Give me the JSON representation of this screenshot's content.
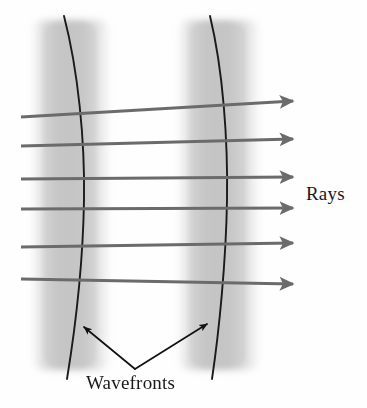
{
  "figure": {
    "background_color": "#fefefe",
    "labels": {
      "rays": "Rays",
      "wavefronts": "Wavefronts"
    },
    "colors": {
      "ray_stroke": "#6b6b6b",
      "wavefront_stroke": "#1a1a1a",
      "band_fill": "#c9c9c9",
      "pointer_stroke": "#111111",
      "text": "#1a1a1a"
    },
    "wavefront_bands": [
      {
        "name": "left-band",
        "x_start": 30,
        "x_end": 112,
        "y_start": 18,
        "y_end": 372
      },
      {
        "name": "right-band",
        "x_start": 176,
        "x_end": 262,
        "y_start": 18,
        "y_end": 372
      }
    ],
    "wavefront_curves": [
      {
        "name": "left-wavefront",
        "top": {
          "x": 64,
          "y": 16
        },
        "mid": {
          "x": 84,
          "y": 196
        },
        "bottom": {
          "x": 67,
          "y": 378
        }
      },
      {
        "name": "right-wavefront",
        "top": {
          "x": 210,
          "y": 16
        },
        "mid": {
          "x": 227,
          "y": 196
        },
        "bottom": {
          "x": 212,
          "y": 378
        }
      }
    ],
    "rays": [
      {
        "index": 1,
        "x1": 21,
        "y1": 117,
        "x2": 299,
        "y2": 100
      },
      {
        "index": 2,
        "x1": 21,
        "y1": 146,
        "x2": 299,
        "y2": 138
      },
      {
        "index": 3,
        "x1": 21,
        "y1": 179,
        "x2": 299,
        "y2": 177
      },
      {
        "index": 4,
        "x1": 21,
        "y1": 209,
        "x2": 299,
        "y2": 208
      },
      {
        "index": 5,
        "x1": 21,
        "y1": 247,
        "x2": 299,
        "y2": 243
      },
      {
        "index": 6,
        "x1": 21,
        "y1": 279,
        "x2": 299,
        "y2": 285
      }
    ],
    "pointers": [
      {
        "name": "left-pointer",
        "from": {
          "x": 135,
          "y": 369
        },
        "to": {
          "x": 79,
          "y": 323
        }
      },
      {
        "name": "right-pointer",
        "from": {
          "x": 135,
          "y": 369
        },
        "to": {
          "x": 212,
          "y": 320
        }
      }
    ]
  }
}
